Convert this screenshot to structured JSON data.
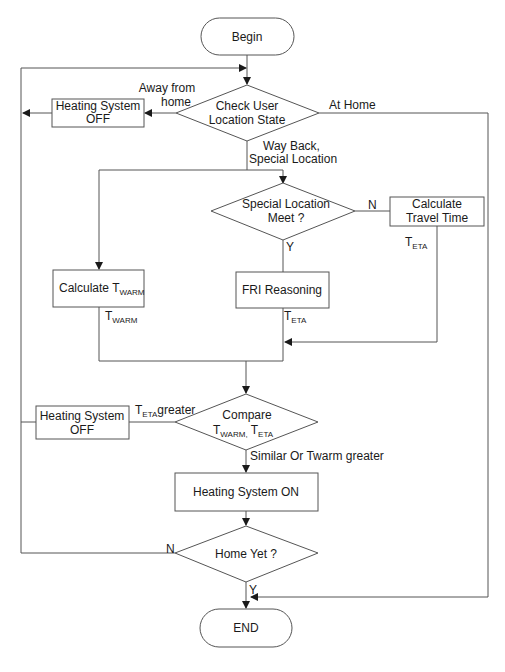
{
  "diagram": {
    "type": "flowchart",
    "nodes": {
      "begin": {
        "label": "Begin",
        "shape": "terminal"
      },
      "check_location": {
        "line1": "Check User",
        "line2": "Location State",
        "shape": "decision"
      },
      "heating_off_1": {
        "line1": "Heating System",
        "line2": "OFF",
        "shape": "process"
      },
      "special_location": {
        "line1": "Special Location",
        "line2": "Meet ?",
        "shape": "decision"
      },
      "calc_travel": {
        "line1": "Calculate",
        "line2": "Travel Time",
        "shape": "process"
      },
      "calc_twarm": {
        "prefix": "Calculate T",
        "sub": "WARM",
        "shape": "process"
      },
      "fri_reasoning": {
        "label": "FRI Reasoning",
        "shape": "process"
      },
      "compare": {
        "line1": "Compare",
        "line2_t1": "T",
        "line2_sub1": "WARM,",
        "line2_t2": " T",
        "line2_sub2": "ETA",
        "shape": "decision"
      },
      "heating_off_2": {
        "line1": "Heating System",
        "line2": "OFF",
        "shape": "process"
      },
      "heating_on": {
        "label": "Heating System ON",
        "shape": "process"
      },
      "home_yet": {
        "label": "Home Yet ?",
        "shape": "decision"
      },
      "end": {
        "label": "END",
        "shape": "terminal"
      }
    },
    "edge_labels": {
      "away_line1": "Away from",
      "away_line2": "home",
      "at_home": "At Home",
      "way_back_line1": "Way Back,",
      "way_back_line2": "Special Location",
      "special_n": "N",
      "special_y": "Y",
      "travel_teta_t": "T",
      "travel_teta_sub": "ETA",
      "twarm_t": "T",
      "twarm_sub": "WARM",
      "fri_teta_t": "T",
      "fri_teta_sub": "ETA",
      "teta_greater_t": "T",
      "teta_greater_sub": "ETA",
      "teta_greater_suffix": "greater",
      "similar": "Similar Or Twarm greater",
      "home_n": "N",
      "home_y": "Y"
    },
    "colors": {
      "stroke": "#555555",
      "text": "#1a1a1a",
      "background": "#ffffff"
    }
  }
}
